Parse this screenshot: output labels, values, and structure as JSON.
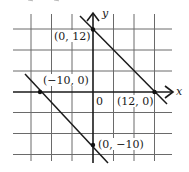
{
  "figure": {
    "axes": {
      "x_label": "x",
      "y_label": "y",
      "origin_label": "0"
    },
    "grid": {
      "units_per_square": 4,
      "x_range": [
        -16,
        12
      ],
      "y_range": [
        -16,
        12
      ]
    },
    "lines": [
      {
        "name": "upper-line",
        "equation": "x + y = 12",
        "points": [
          {
            "label": "(0, 12)",
            "x": 0,
            "y": 12
          },
          {
            "label": "(12, 0)",
            "x": 12,
            "y": 0
          }
        ]
      },
      {
        "name": "lower-line",
        "equation": "x + y = -10",
        "points": [
          {
            "label": "(−10, 0)",
            "x": -10,
            "y": 0
          },
          {
            "label": "(0, −10)",
            "x": 0,
            "y": -10
          }
        ]
      }
    ],
    "colors": {
      "ink": "#1a1a1a",
      "grid": "#6a6a6a",
      "background": "#ffffff"
    }
  }
}
